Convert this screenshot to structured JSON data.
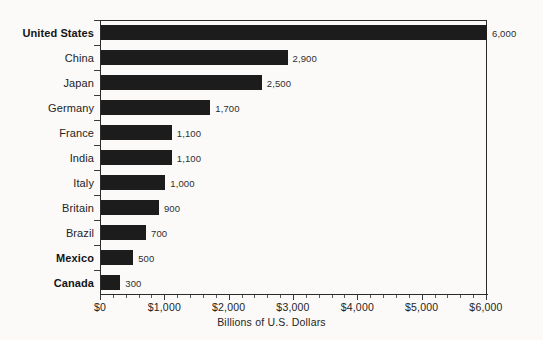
{
  "chart_data": {
    "type": "bar",
    "orientation": "horizontal",
    "title": "",
    "xlabel": "Billions of U.S. Dollars",
    "ylabel": "",
    "xlim": [
      0,
      6000
    ],
    "xticks": [
      0,
      1000,
      2000,
      3000,
      4000,
      5000,
      6000
    ],
    "xtick_labels": [
      "$0",
      "$1,000",
      "$2,000",
      "$3,000",
      "$4,000",
      "$5,000",
      "$6,000"
    ],
    "minor_tick_step": 200,
    "grid": false,
    "legend": null,
    "categories": [
      "United States",
      "China",
      "Japan",
      "Germany",
      "France",
      "India",
      "Italy",
      "Britain",
      "Brazil",
      "Mexico",
      "Canada"
    ],
    "values": [
      6000,
      2900,
      2500,
      1700,
      1100,
      1100,
      1000,
      900,
      700,
      500,
      300
    ],
    "value_labels": [
      "6,000",
      "2,900",
      "2,500",
      "1,700",
      "1,100",
      "1,100",
      "1,000",
      "900",
      "700",
      "500",
      "300"
    ],
    "emphasized_categories": [
      "United States",
      "Mexico",
      "Canada"
    ],
    "bar_color": "#1c1c1c",
    "background_color": "#fbfaf8",
    "axis_color": "#2b2b2b"
  }
}
